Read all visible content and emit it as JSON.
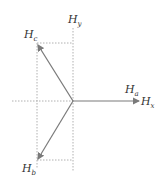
{
  "diagram": {
    "title": "",
    "labels": {
      "hy": {
        "main": "H",
        "sub": "y"
      },
      "hc": {
        "main": "H",
        "sub": "c"
      },
      "ha": {
        "main": "H",
        "sub": "a"
      },
      "hx": {
        "main": "H",
        "sub": "x"
      },
      "hb": {
        "main": "H",
        "sub": "b"
      }
    },
    "colors": {
      "arrow": "#7a7a7a",
      "guide": "#b0b0b0",
      "text": "#333333"
    }
  }
}
